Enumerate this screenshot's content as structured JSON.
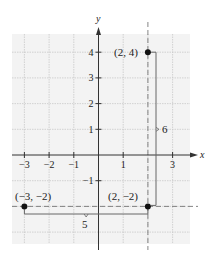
{
  "chart_data": {
    "type": "scatter",
    "title": "",
    "xlabel": "x",
    "ylabel": "y",
    "xlim": [
      -3.5,
      3.7
    ],
    "ylim": [
      -3.5,
      4.7
    ],
    "grid": true,
    "x_ticks": [
      -3,
      -2,
      -1,
      1,
      3
    ],
    "x_tick_labels": [
      "−3",
      "−2",
      "−1",
      "1",
      "3"
    ],
    "y_ticks": [
      4,
      3,
      2,
      1,
      -1
    ],
    "y_tick_labels": [
      "4",
      "3",
      "2",
      "1",
      "−1"
    ],
    "points": [
      {
        "x": 2,
        "y": 4,
        "label": "(2, 4)"
      },
      {
        "x": -3,
        "y": -2,
        "label": "(−3, −2)"
      },
      {
        "x": 2,
        "y": -2,
        "label": "(2, −2)"
      }
    ],
    "guide_lines": [
      {
        "orientation": "vertical",
        "at": 2,
        "style": "dashed"
      },
      {
        "orientation": "horizontal",
        "at": -2,
        "style": "dashed"
      }
    ],
    "distances": [
      {
        "from": "(2, 4)",
        "to": "(2, -2)",
        "orientation": "vertical",
        "label": "6"
      },
      {
        "from": "(-3, -2)",
        "to": "(2, -2)",
        "orientation": "horizontal",
        "label": "5"
      }
    ]
  },
  "labels": {
    "x_axis": "x",
    "y_axis": "y",
    "point_a": "(2, 4)",
    "point_b": "(−3, −2)",
    "point_c": "(2, −2)",
    "vertical_distance": "6",
    "horizontal_distance": "5"
  },
  "colors": {
    "grid_background": "#f3f3f3",
    "grid_line": "#c8c8c8",
    "axis": "#333333",
    "point": "#111111",
    "bracket": "#666666",
    "dashed": "#777777"
  }
}
